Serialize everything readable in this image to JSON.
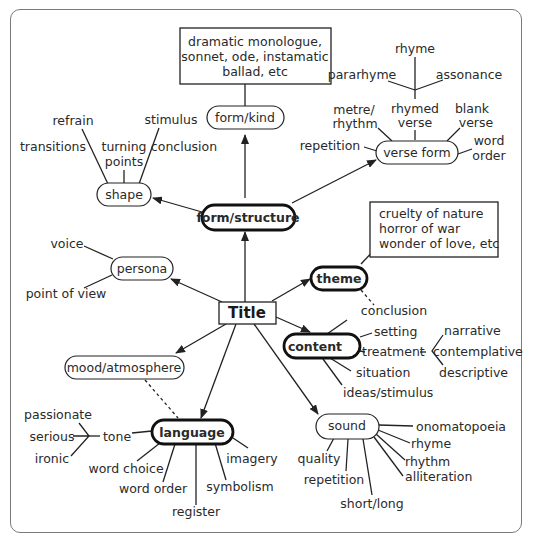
{
  "diagram": {
    "type": "mind-map",
    "center": {
      "label": "Title"
    },
    "main_nodes": {
      "form_structure": {
        "label": "form/structure",
        "emphasis": "bold"
      },
      "form_kind": {
        "label": "form/kind"
      },
      "form_kind_examples": {
        "lines": [
          "dramatic monologue,",
          "sonnet, ode, instamatic",
          "ballad, etc"
        ]
      },
      "shape": {
        "label": "shape"
      },
      "verse_form": {
        "label": "verse form"
      },
      "persona": {
        "label": "persona"
      },
      "theme": {
        "label": "theme",
        "emphasis": "bold"
      },
      "theme_examples": {
        "lines": [
          "cruelty of nature",
          "horror of war",
          "wonder of love, etc"
        ]
      },
      "content": {
        "label": "content",
        "emphasis": "bold"
      },
      "mood_atmosphere": {
        "label": "mood/atmosphere"
      },
      "language": {
        "label": "language",
        "emphasis": "bold"
      },
      "sound": {
        "label": "sound"
      }
    },
    "shape_branches": [
      "refrain",
      "stimulus",
      "transitions",
      "turning",
      "points",
      "conclusion"
    ],
    "verse_form_branches": {
      "rhymed_verse": [
        "rhymed",
        "verse"
      ],
      "rhyme_sub": {
        "top": "rhyme",
        "left": "pararhyme",
        "right": "assonance"
      },
      "metre_rhythm": [
        "metre/",
        "rhythm"
      ],
      "blank_verse": [
        "blank",
        "verse"
      ],
      "repetition": "repetition",
      "word_order": [
        "word",
        "order"
      ]
    },
    "persona_branches": [
      "voice",
      "point of view"
    ],
    "content_branches": {
      "conclusion": "conclusion",
      "setting": "setting",
      "treatment": "treatment",
      "treatment_sub": [
        "narrative",
        "contemplative",
        "descriptive"
      ],
      "situation": "situation",
      "ideas_stimulus": "ideas/stimulus"
    },
    "language_branches": {
      "tone": "tone",
      "tone_sub": [
        "passionate",
        "serious",
        "ironic"
      ],
      "word_choice": "word choice",
      "word_order": "word order",
      "register": "register",
      "symbolism": "symbolism",
      "imagery": "imagery"
    },
    "sound_branches": {
      "onomatopoeia": "onomatopoeia",
      "rhyme": "rhyme",
      "rhythm": "rhythm",
      "alliteration": "alliteration",
      "quality": "quality",
      "repetition": "repetition",
      "short_long": "short/long"
    }
  }
}
